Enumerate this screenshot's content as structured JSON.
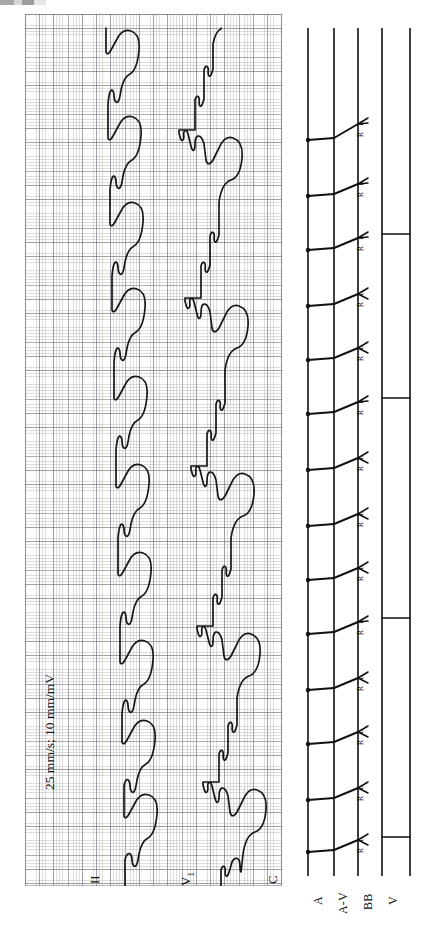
{
  "figure": {
    "kind": "ecg-rhythm-strip-with-ladder-diagram",
    "orientation_note": "page rotated 90 degrees counter-clockwise",
    "calibration_caption": "25 mm/s;  10 mm/mV",
    "paper_speed": "25 mm/s",
    "gain": "10 mm/mV"
  },
  "ecg": {
    "panel_label": "ecg-graph-paper",
    "grid": {
      "fine_mm": 1,
      "bold_every": 5,
      "fine_color": "#96969b",
      "bold_color": "#6e7078",
      "paper_color": "#fdfdfd"
    },
    "trace_color": "#17171a",
    "leads": [
      {
        "id": "ii",
        "label": "II",
        "sub": "",
        "name": "lead-II"
      },
      {
        "id": "v1",
        "label": "V",
        "sub": "1",
        "name": "lead-V1"
      },
      {
        "id": "c",
        "label": "C",
        "sub": "",
        "name": "lead-C"
      }
    ]
  },
  "ladder": {
    "title": "ladder-diagram",
    "rows": [
      {
        "id": "a",
        "label": "A",
        "name": "ladder-row-atrium"
      },
      {
        "id": "av",
        "label": "A-V",
        "name": "ladder-row-av-node"
      },
      {
        "id": "bb",
        "label": "BB",
        "name": "ladder-row-bundle-branches"
      },
      {
        "id": "v",
        "label": "V",
        "name": "ladder-row-ventricle"
      }
    ],
    "branch_labels": {
      "right": "R",
      "left": "L",
      "combined": "R L"
    },
    "beat_count": 14,
    "conducted_beat_count": 5,
    "line_color": "#111111"
  }
}
